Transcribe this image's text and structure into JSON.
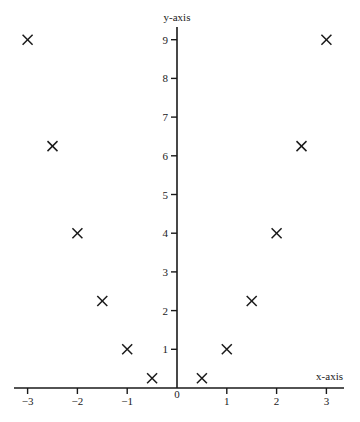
{
  "chart_data": {
    "type": "scatter",
    "title": "",
    "xlabel": "x-axis",
    "ylabel": "y-axis",
    "xlim": [
      -3.3,
      3.3
    ],
    "ylim": [
      0,
      9.3
    ],
    "grid": false,
    "legend": null,
    "marker": "x",
    "x_ticks": [
      -3,
      -2,
      -1,
      0,
      1,
      2,
      3
    ],
    "x_tick_labels": [
      "−3",
      "−2",
      "−1",
      "0",
      "1",
      "2",
      "3"
    ],
    "y_ticks": [
      1,
      2,
      3,
      4,
      5,
      6,
      7,
      8,
      9
    ],
    "y_tick_labels": [
      "1",
      "2",
      "3",
      "4",
      "5",
      "6",
      "7",
      "8",
      "9"
    ],
    "series": [
      {
        "name": "points",
        "x": [
          -3,
          -2.5,
          -2,
          -1.5,
          -1,
          -0.5,
          0.5,
          1,
          1.5,
          2,
          2.5,
          3
        ],
        "y": [
          9,
          6.25,
          4,
          2.25,
          1,
          0.25,
          0.25,
          1,
          2.25,
          4,
          6.25,
          9
        ]
      }
    ]
  },
  "labels": {
    "x_axis": "x-axis",
    "y_axis": "y-axis",
    "origin": "0"
  },
  "colors": {
    "ink": "#1a1a1a",
    "background": "#ffffff"
  }
}
